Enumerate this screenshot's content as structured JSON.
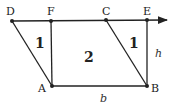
{
  "diagram": {
    "colors": {
      "stroke": "#222222",
      "background": "#ffffff"
    },
    "points": [
      {
        "name": "D",
        "label": "D"
      },
      {
        "name": "F",
        "label": "F"
      },
      {
        "name": "C",
        "label": "C"
      },
      {
        "name": "E",
        "label": "E"
      },
      {
        "name": "A",
        "label": "A"
      },
      {
        "name": "B",
        "label": "B"
      }
    ],
    "regions": [
      {
        "name": "triangle-left",
        "label": "1"
      },
      {
        "name": "rectangle",
        "label": "2"
      },
      {
        "name": "triangle-right",
        "label": "1"
      }
    ],
    "variables": {
      "base": "b",
      "height": "h"
    },
    "segments": [
      "DE (ray with arrow)",
      "DA",
      "FA",
      "CB",
      "EB",
      "AB"
    ]
  }
}
